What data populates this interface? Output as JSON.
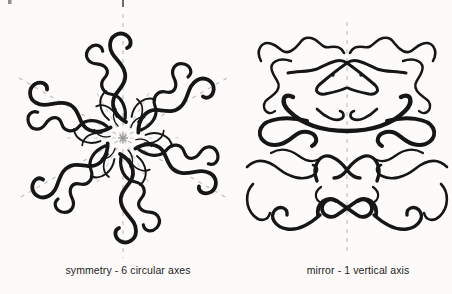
{
  "canvas": {
    "width": 452,
    "height": 294
  },
  "palette": {
    "background": "#fcfbf9",
    "ink": "#161616",
    "axis_dash": "#bdbdbd",
    "center_marker": "#9c9c9c",
    "label_text": "#1b1b1b"
  },
  "figures": {
    "left": {
      "label": "symmetry - 6 circular axes",
      "symmetry_type": "rotational",
      "axes_count": 6,
      "center_marker": "asterisk"
    },
    "right": {
      "label": "mirror - 1 vertical axis",
      "symmetry_type": "mirror",
      "axes_count": 1,
      "eye_dots": 2
    }
  }
}
